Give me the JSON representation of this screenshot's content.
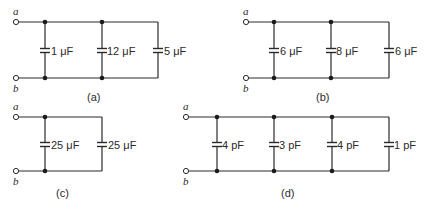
{
  "diagram": {
    "terminal_top": "a",
    "terminal_bottom": "b",
    "circuits": [
      {
        "id": "a",
        "label": "(a)",
        "capacitors": [
          {
            "value": "1 μF"
          },
          {
            "value": "12 μF"
          },
          {
            "value": "5 μF"
          }
        ]
      },
      {
        "id": "b",
        "label": "(b)",
        "capacitors": [
          {
            "value": "6 μF"
          },
          {
            "value": "8 μF"
          },
          {
            "value": "6 μF"
          }
        ]
      },
      {
        "id": "c",
        "label": "(c)",
        "capacitors": [
          {
            "value": "25 μF"
          },
          {
            "value": "25 μF"
          }
        ]
      },
      {
        "id": "d",
        "label": "(d)",
        "capacitors": [
          {
            "value": "4 pF"
          },
          {
            "value": "3 pF"
          },
          {
            "value": "4 pF"
          },
          {
            "value": "1 pF"
          }
        ]
      }
    ]
  }
}
